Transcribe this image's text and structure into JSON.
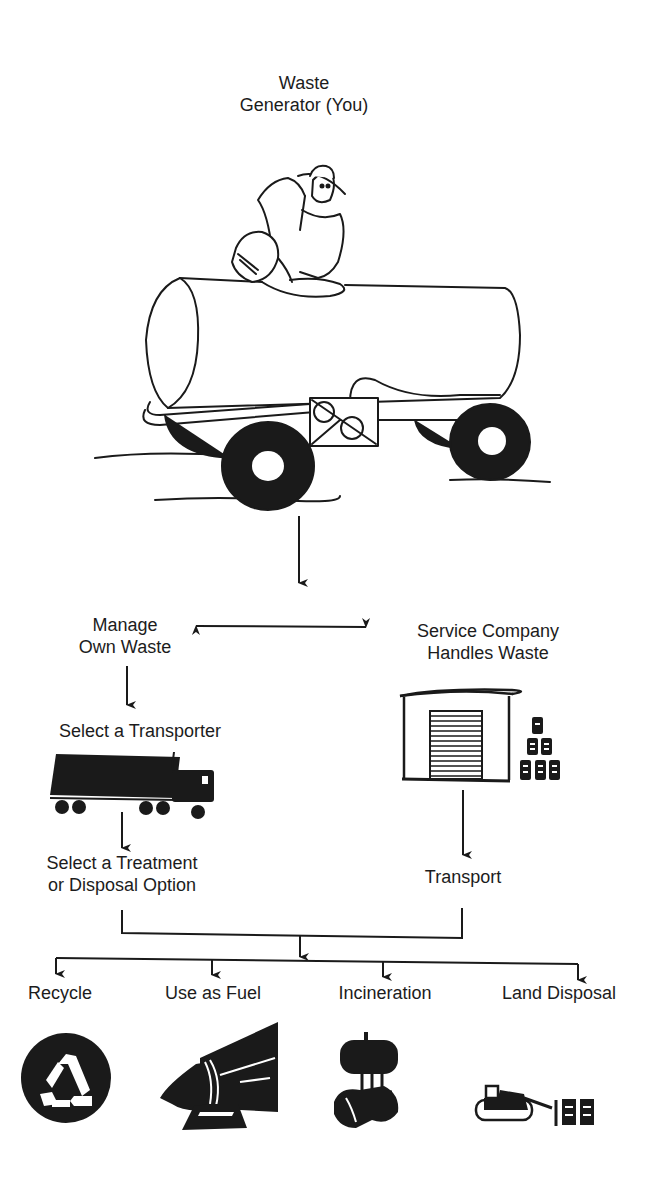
{
  "diagram": {
    "start": {
      "line1": "Waste",
      "line2": "Generator (You)"
    },
    "branches": {
      "left": {
        "line1": "Manage",
        "line2": "Own Waste"
      },
      "right": {
        "line1": "Service Company",
        "line2": "Handles Waste"
      }
    },
    "left_path": {
      "step1": "Select a Transporter",
      "step2": {
        "line1": "Select a Treatment",
        "line2": "or Disposal Option"
      }
    },
    "right_path": {
      "step1": "Transport"
    },
    "outcomes": [
      {
        "label": "Recycle",
        "icon": "recycle-icon"
      },
      {
        "label": "Use as Fuel",
        "icon": "kiln-icon"
      },
      {
        "label": "Incineration",
        "icon": "incinerator-icon"
      },
      {
        "label": "Land Disposal",
        "icon": "bulldozer-icon"
      }
    ],
    "illustrations": [
      "farmer-pouring-into-tank-trailer",
      "semi-truck-icon",
      "warehouse-icon",
      "stacked-drums-icon"
    ],
    "colors": {
      "ink": "#1a1a1a",
      "background": "#ffffff"
    }
  }
}
